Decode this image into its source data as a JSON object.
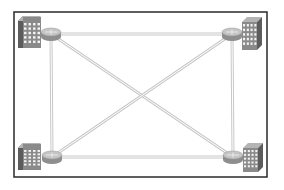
{
  "diagram": {
    "type": "network-topology",
    "topology": "full-mesh",
    "frame": {
      "x": 14,
      "y": 12,
      "width": 253,
      "height": 165,
      "stroke": "#2a2a2a"
    },
    "colors": {
      "link": "#c8c8c8",
      "link_inner": "#ffffff",
      "building_front": "#8a8a8a",
      "building_side": "#5c5c5c",
      "building_top": "#b4b4b4",
      "window": "#f2f2f2",
      "router_top": "#c4c4c4",
      "router_side": "#8e8e8e"
    },
    "sites": [
      {
        "id": "site-top-left",
        "building": {
          "x": 18,
          "y": 16,
          "w": 23,
          "h": 32,
          "side": "left"
        },
        "router": {
          "cx": 51,
          "cy": 34
        }
      },
      {
        "id": "site-top-right",
        "building": {
          "x": 242,
          "y": 17,
          "w": 20,
          "h": 33,
          "side": "right"
        },
        "router": {
          "cx": 232,
          "cy": 34
        }
      },
      {
        "id": "site-bottom-left",
        "building": {
          "x": 18,
          "y": 143,
          "w": 23,
          "h": 27,
          "side": "left"
        },
        "router": {
          "cx": 52,
          "cy": 157
        }
      },
      {
        "id": "site-bottom-right",
        "building": {
          "x": 243,
          "y": 143,
          "w": 20,
          "h": 29,
          "side": "right"
        },
        "router": {
          "cx": 233,
          "cy": 157
        }
      }
    ],
    "links": [
      {
        "from": 0,
        "to": 1
      },
      {
        "from": 2,
        "to": 3
      },
      {
        "from": 0,
        "to": 2
      },
      {
        "from": 1,
        "to": 3
      },
      {
        "from": 0,
        "to": 3
      },
      {
        "from": 1,
        "to": 2
      }
    ]
  }
}
